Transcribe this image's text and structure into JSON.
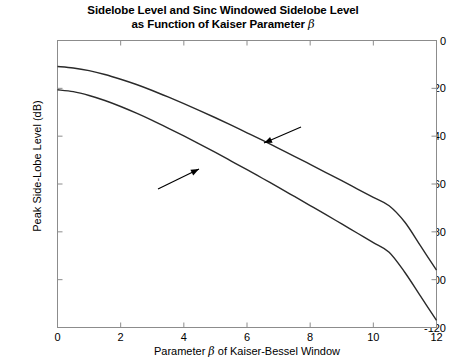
{
  "chart_data": {
    "type": "line",
    "title_line1": "Sidelobe Level and Sinc Windowed Sidelobe Level",
    "title_line2_pre": "as Function of Kaiser Parameter ",
    "title_line2_sym": "β",
    "xlabel_pre": "Parameter ",
    "xlabel_sym": "β",
    "xlabel_post": " of Kaiser-Bessel Window",
    "ylabel": "Peak Side-Lobe Level (dB)",
    "xlim": [
      0,
      12
    ],
    "ylim": [
      -120,
      0
    ],
    "xticks": [
      "0",
      "2",
      "4",
      "6",
      "8",
      "10",
      "12"
    ],
    "xtick_values": [
      0,
      2,
      4,
      6,
      8,
      10,
      12
    ],
    "yticks": [
      "0",
      "-20",
      "-40",
      "-60",
      "-80",
      "-100",
      "-120"
    ],
    "ytick_values": [
      0,
      -20,
      -40,
      -60,
      -80,
      -100,
      -120
    ],
    "grid": false,
    "legend": "none",
    "line_color": "#2a2a2a",
    "axis_color": "#8c8c8c",
    "x": [
      0,
      0.5,
      1,
      1.5,
      2,
      2.5,
      3,
      3.5,
      4,
      4.5,
      5,
      5.5,
      6,
      6.5,
      7,
      7.5,
      8,
      8.5,
      9,
      9.5,
      10,
      10.5,
      11,
      11.5,
      12
    ],
    "series": [
      {
        "name": "Maximum Sidelobe Level of Kaiser Window",
        "values": [
          -10.9,
          -11.5,
          -12.6,
          -14.2,
          -16.2,
          -18.4,
          -20.9,
          -23.6,
          -26.4,
          -29.3,
          -32.3,
          -35.4,
          -38.6,
          -41.8,
          -45.1,
          -48.4,
          -51.8,
          -55.2,
          -58.6,
          -62.1,
          -65.6,
          -69.1,
          -76.0,
          -86.0,
          -96.0
        ]
      },
      {
        "name": "Maximum Sidelobe Level of Kaiser Windowed Sinc",
        "values": [
          -20.6,
          -21.4,
          -23.0,
          -25.1,
          -27.6,
          -30.4,
          -33.4,
          -36.6,
          -39.9,
          -43.3,
          -46.8,
          -50.4,
          -54.0,
          -57.7,
          -61.4,
          -65.2,
          -69.0,
          -72.8,
          -76.7,
          -80.6,
          -84.5,
          -88.5,
          -97.0,
          -107.0,
          -117.0
        ]
      }
    ],
    "annotations": [
      {
        "id": "kaiser-window",
        "line1": "Maximum Sidelobe Level",
        "line2": "of Kaiser Window",
        "text_left": 273,
        "text_top": 99,
        "arrow": {
          "x1": 301,
          "y1": 127,
          "x2": 264,
          "y2": 143
        }
      },
      {
        "id": "kaiser-windowed-sinc",
        "line1": "Maximum Sidelobe Level of",
        "line2": "Kaiser Windowed Sinc",
        "text_left": 64,
        "text_top": 190,
        "arrow": {
          "x1": 158,
          "y1": 189,
          "x2": 199,
          "y2": 169
        }
      }
    ]
  }
}
